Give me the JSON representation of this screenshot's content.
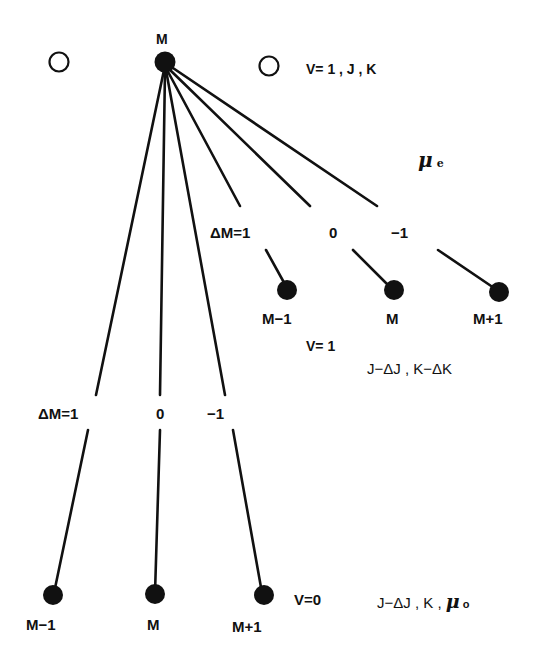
{
  "diagram": {
    "colors": {
      "ink": "#111111",
      "background": "#ffffff"
    },
    "top_level": {
      "node_label": "M",
      "state_label": "V= 1 , J , K"
    },
    "upper_branch": {
      "delta_labels": [
        "ΔM=1",
        "0",
        "−1"
      ],
      "node_labels": [
        "M−1",
        "M",
        "M+1"
      ],
      "v_label": "V= 1",
      "state_label": "J−ΔJ , K−ΔK",
      "dipole_symbol": "μ",
      "dipole_subscript": "e"
    },
    "lower_branch": {
      "delta_labels": [
        "ΔM=1",
        "0",
        "−1"
      ],
      "node_labels": [
        "M−1",
        "M",
        "M+1"
      ],
      "v_label": "V=0",
      "state_label": "J−ΔJ , K  ,",
      "dipole_symbol": "μ",
      "dipole_subscript": "o"
    }
  }
}
